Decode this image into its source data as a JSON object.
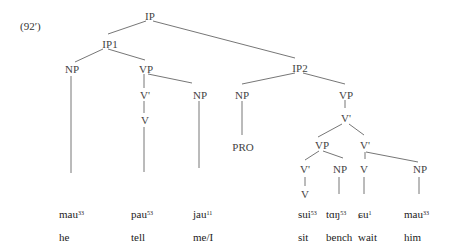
{
  "example_label": "(92′)",
  "nodes": {
    "ip": "IP",
    "ip1": "IP1",
    "ip1_np": "NP",
    "ip1_vp": "VP",
    "ip1_vbar": "V'",
    "ip1_v": "V",
    "ip1_np_obj": "NP",
    "ip2": "IP2",
    "ip2_np": "NP",
    "ip2_pro": "PRO",
    "ip2_vp": "VP",
    "ip2_vbar": "V'",
    "inner_vp": "VP",
    "inner_vbar": "V'",
    "inner_v": "V",
    "inner_np": "NP",
    "right_vbar": "V'",
    "right_v": "V",
    "right_np": "NP"
  },
  "words": [
    {
      "form": "mau",
      "tone": "33",
      "gloss": "he"
    },
    {
      "form": "pau",
      "tone": "53",
      "gloss": "tell"
    },
    {
      "form": "jau",
      "tone": "11",
      "gloss": "me/I"
    },
    {
      "form": "sui",
      "tone": "53",
      "gloss": "sit"
    },
    {
      "form": "tɑŋ",
      "tone": "53",
      "gloss": "bench"
    },
    {
      "form": "ɕu",
      "tone": "1",
      "gloss": "wait"
    },
    {
      "form": "mau",
      "tone": "33",
      "gloss": "him"
    }
  ]
}
